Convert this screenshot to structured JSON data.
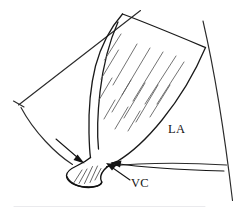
{
  "figure": {
    "type": "line-diagram",
    "background_color": "#ffffff",
    "ink_color": "#1a1a1a",
    "width": 242,
    "height": 212
  },
  "labels": {
    "left_atrium": "LA",
    "vena_contracta": "VC"
  },
  "annotations": [
    {
      "name": "proximal-flow-arrow",
      "target": "jet neck, upper left side",
      "direction": "down-right",
      "has_text": false
    },
    {
      "name": "vena-contracta-arrow",
      "label": "VC",
      "target": "narrowest neck of the jet",
      "direction": "up-left"
    }
  ],
  "structures": [
    {
      "name": "ultrasound-sector-left-edge",
      "kind": "straight-line"
    },
    {
      "name": "ultrasound-sector-right-edge",
      "kind": "straight-line"
    },
    {
      "name": "ultrasound-sector-arc",
      "kind": "arc"
    },
    {
      "name": "sector-depth-tick",
      "kind": "tick-mark"
    },
    {
      "name": "regurgitant-jet-outline",
      "kind": "closed-curve"
    },
    {
      "name": "jet-hatching",
      "kind": "diagonal-hatch",
      "stroke_count": 15
    },
    {
      "name": "vena-contracta-neck",
      "kind": "narrow-waist"
    },
    {
      "name": "left-atrium-region",
      "kind": "open-region"
    }
  ],
  "colors": {
    "ink": "#1a1a1a",
    "hatch": "#5a5a5a",
    "sector": "#2b2b2b",
    "baseline": "#e4e4e8",
    "background": "#ffffff"
  }
}
